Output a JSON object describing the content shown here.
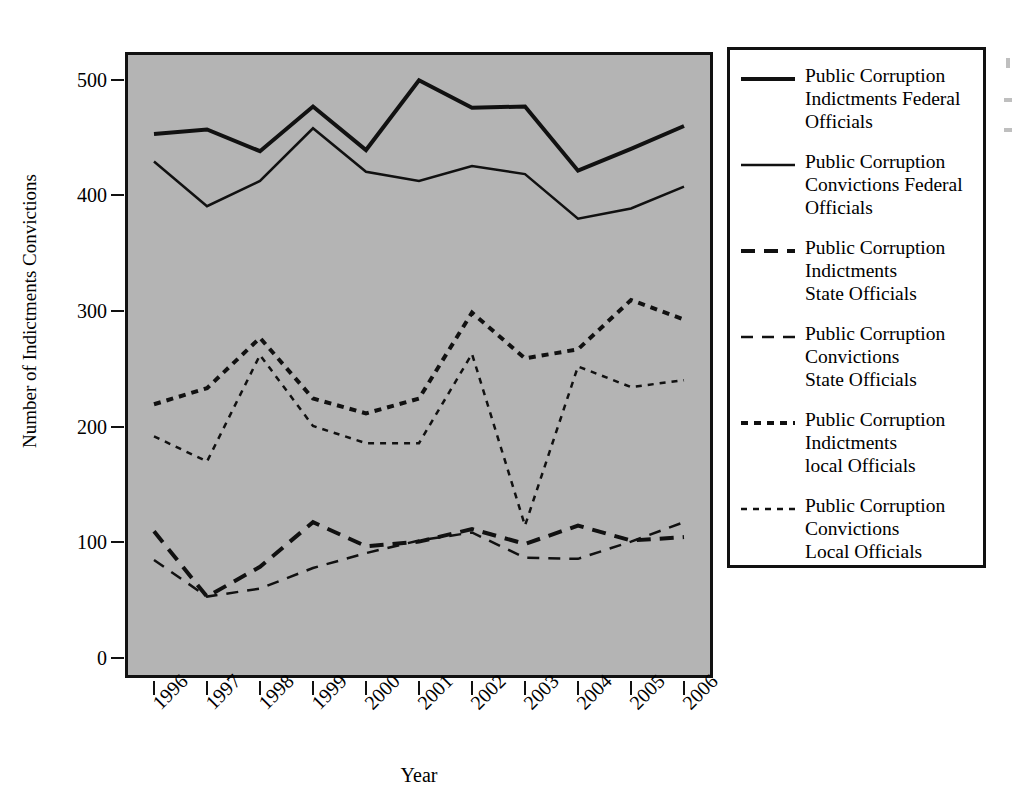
{
  "chart_data": {
    "type": "line",
    "title": "",
    "xlabel": "Year",
    "ylabel": "Number of Indictments Convictions",
    "x": [
      1996,
      1997,
      1998,
      1999,
      2000,
      2001,
      2002,
      2003,
      2004,
      2005,
      2006
    ],
    "xticklabels": [
      "1996",
      "1997",
      "1998",
      "1999",
      "2000",
      "2001",
      "2002",
      "2003",
      "2004",
      "2005",
      "2006"
    ],
    "yticks": [
      0,
      100,
      200,
      300,
      400,
      500
    ],
    "yticklabels": [
      "0",
      "100",
      "200",
      "300",
      "400",
      "500"
    ],
    "ylim": [
      0,
      550
    ],
    "grid": false,
    "legend_position": "right-outside",
    "plot_background": "#b4b4b4",
    "line_color": "#111111",
    "series": [
      {
        "name": "Public Corruption Indictments Federal Officials",
        "style": "solid",
        "width": 4,
        "values": [
          455,
          459,
          440,
          479,
          441,
          502,
          478,
          479,
          423,
          442,
          462
        ]
      },
      {
        "name": "Public Corruption Convictions Federal Officials",
        "style": "solid",
        "width": 2.5,
        "values": [
          431,
          392,
          414,
          460,
          422,
          414,
          427,
          420,
          381,
          390,
          409
        ]
      },
      {
        "name": "Public Corruption Indictments State Officials",
        "style": "dash-long",
        "width": 4,
        "values": [
          108,
          51,
          77,
          116,
          95,
          99,
          110,
          97,
          113,
          100,
          103
        ]
      },
      {
        "name": "Public Corruption Convictions State Officials",
        "style": "dash-long",
        "width": 2.5,
        "values": [
          83,
          51,
          58,
          76,
          89,
          100,
          107,
          85,
          84,
          99,
          116
        ]
      },
      {
        "name": "Public Corruption Indictments local Officials",
        "style": "dash-short",
        "width": 4,
        "values": [
          219,
          233,
          277,
          224,
          211,
          224,
          299,
          259,
          267,
          310,
          293
        ]
      },
      {
        "name": "Public Corruption Convictions Local Officials",
        "style": "dash-short",
        "width": 2.5,
        "values": [
          191,
          169,
          262,
          200,
          185,
          185,
          263,
          113,
          252,
          234,
          240
        ]
      }
    ]
  },
  "legend": {
    "items": [
      {
        "label": "Public Corruption\nIndictments Federal\nOfficials",
        "style": "solid",
        "width": 4
      },
      {
        "label": "Public Corruption\nConvictions Federal\nOfficials",
        "style": "solid",
        "width": 2.5
      },
      {
        "label": "Public Corruption\nIndictments\nState Officials",
        "style": "dash-long",
        "width": 4
      },
      {
        "label": "Public Corruption\nConvictions\nState Officials",
        "style": "dash-long",
        "width": 2.5
      },
      {
        "label": "Public Corruption\nIndictments\nlocal Officials",
        "style": "dash-short",
        "width": 4
      },
      {
        "label": "Public Corruption\nConvictions\nLocal Officials",
        "style": "dash-short",
        "width": 2.5
      }
    ]
  }
}
